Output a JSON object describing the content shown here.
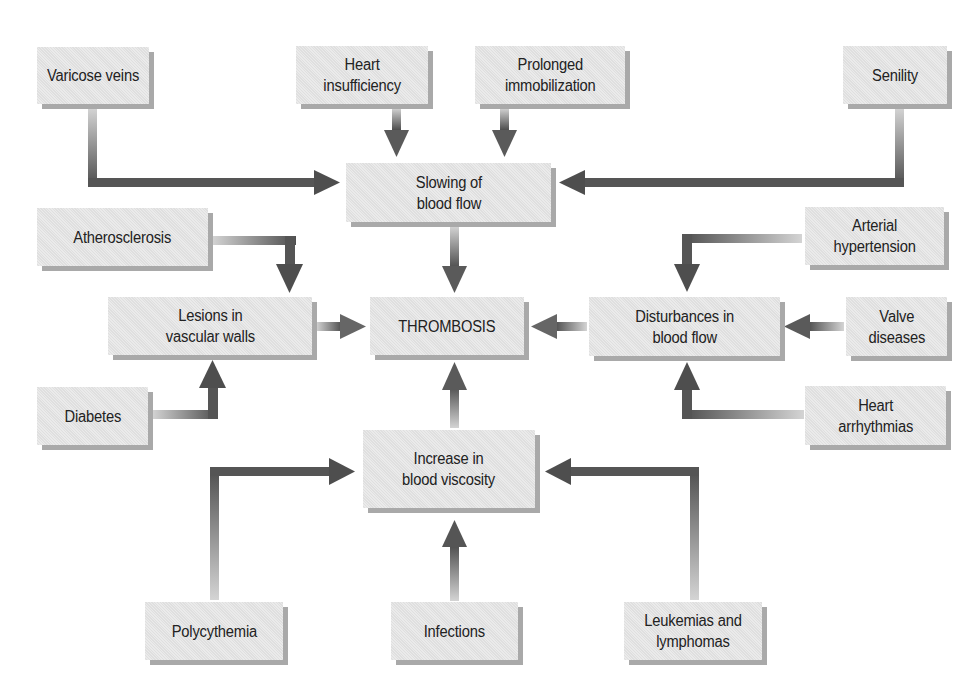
{
  "diagram": {
    "colors": {
      "box_fill": "#e6e6e6",
      "box_shadow": "#a9a9a9",
      "arrow_light": "#d2d2d2",
      "arrow_dark": "#4e4e4e",
      "text": "#222222",
      "background": "#ffffff"
    },
    "nodes": {
      "varicose_veins": "Varicose veins",
      "heart_insufficiency": "Heart\ninsufficiency",
      "prolonged_immobilization": "Prolonged\nimmobilization",
      "senility": "Senility",
      "slowing_blood_flow": "Slowing of\nblood flow",
      "atherosclerosis": "Atherosclerosis",
      "arterial_hypertension": "Arterial\nhypertension",
      "lesions_vascular_walls": "Lesions in\nvascular walls",
      "thrombosis": "THROMBOSIS",
      "disturbances_blood_flow": "Disturbances in\nblood flow",
      "valve_diseases": "Valve\ndiseases",
      "diabetes": "Diabetes",
      "heart_arrhythmias": "Heart\narrhythmias",
      "increase_blood_viscosity": "Increase in\nblood viscosity",
      "polycythemia": "Polycythemia",
      "infections": "Infections",
      "leukemias_lymphomas": "Leukemias and\nlymphomas"
    },
    "edges": [
      {
        "from": "Varicose veins",
        "to": "Slowing of blood flow"
      },
      {
        "from": "Heart insufficiency",
        "to": "Slowing of blood flow"
      },
      {
        "from": "Prolonged immobilization",
        "to": "Slowing of blood flow"
      },
      {
        "from": "Senility",
        "to": "Slowing of blood flow"
      },
      {
        "from": "Slowing of blood flow",
        "to": "THROMBOSIS"
      },
      {
        "from": "Atherosclerosis",
        "to": "Lesions in vascular walls"
      },
      {
        "from": "Diabetes",
        "to": "Lesions in vascular walls"
      },
      {
        "from": "Lesions in vascular walls",
        "to": "THROMBOSIS"
      },
      {
        "from": "Arterial hypertension",
        "to": "Disturbances in blood flow"
      },
      {
        "from": "Valve diseases",
        "to": "Disturbances in blood flow"
      },
      {
        "from": "Heart arrhythmias",
        "to": "Disturbances in blood flow"
      },
      {
        "from": "Disturbances in blood flow",
        "to": "THROMBOSIS"
      },
      {
        "from": "Polycythemia",
        "to": "Increase in blood viscosity"
      },
      {
        "from": "Infections",
        "to": "Increase in blood viscosity"
      },
      {
        "from": "Leukemias and lymphomas",
        "to": "Increase in blood viscosity"
      },
      {
        "from": "Increase in blood viscosity",
        "to": "THROMBOSIS"
      }
    ]
  }
}
